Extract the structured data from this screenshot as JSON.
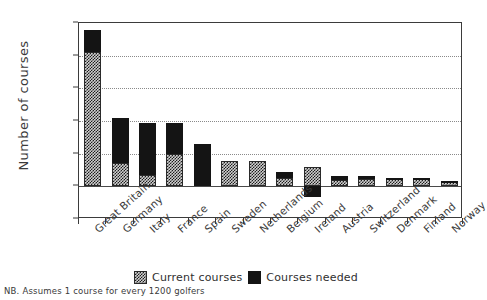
{
  "chart_data": {
    "type": "bar",
    "title": "",
    "xlabel": "",
    "ylabel": "Number of courses",
    "ylim": [
      -500,
      2500
    ],
    "yticks": [
      -500,
      0,
      500,
      1000,
      1500,
      2000,
      2500
    ],
    "ytick_labels": [
      "(500)",
      "0",
      "500",
      "1,000",
      "1,500",
      "2,000",
      "2,500"
    ],
    "grid": true,
    "stacked": true,
    "legend_position": "bottom",
    "categories": [
      "Great Britain",
      "Germany",
      "Italy",
      "France",
      "Spain",
      "Sweden",
      "Netherlands",
      "Belgium",
      "Ireland",
      "Austria",
      "Switzerland",
      "Denmark",
      "Finland",
      "Norway"
    ],
    "series": [
      {
        "name": "Current courses",
        "color": "#cfcfcf",
        "values": [
          2050,
          350,
          175,
          500,
          0,
          390,
          390,
          120,
          290,
          95,
          110,
          105,
          105,
          70
        ]
      },
      {
        "name": "Courses needed",
        "color": "#141414",
        "values": [
          350,
          700,
          800,
          475,
          650,
          0,
          0,
          95,
          -160,
          60,
          55,
          15,
          20,
          15
        ]
      }
    ],
    "totals": [
      2400,
      1050,
      975,
      975,
      650,
      390,
      390,
      215,
      130,
      155,
      165,
      120,
      125,
      85
    ],
    "annotations": [
      "NB. Assumes 1 course for every 1200 golfers"
    ]
  },
  "legend": {
    "items": [
      {
        "label": "Current courses",
        "swatch": "checkered-swatch"
      },
      {
        "label": "Courses needed",
        "swatch": "black-swatch"
      }
    ]
  },
  "footnote": {
    "text": "NB. Assumes 1 course for every 1200 golfers"
  }
}
